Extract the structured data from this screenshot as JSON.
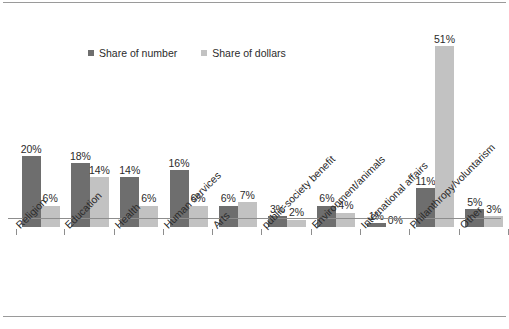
{
  "figure": {
    "background": "#ffffff",
    "border_color": "#9a9a9a",
    "axis_color": "#8d8d8d"
  },
  "legend": {
    "position": "top-left-inside",
    "entries": [
      {
        "label": "Share of number",
        "color": "#6e6e6e",
        "marker": "square-swatch-icon"
      },
      {
        "label": "Share of dollars",
        "color": "#c2c2c2",
        "marker": "square-swatch-icon"
      }
    ]
  },
  "chart_data": {
    "type": "bar",
    "title": "",
    "subtitle": "",
    "xlabel": "",
    "ylabel": "",
    "ylim": [
      0,
      55
    ],
    "grid": false,
    "legend_position": "top-left",
    "value_suffix": "%",
    "categories": [
      "Religion",
      "Education",
      "Health",
      "Human services",
      "Arts",
      "public-society benefit",
      "Environment/animals",
      "International affairs",
      "Philanthropy/voluntarism",
      "Other"
    ],
    "series": [
      {
        "name": "Share of number",
        "color": "#6e6e6e",
        "values": [
          20,
          18,
          14,
          16,
          6,
          3,
          6,
          1,
          11,
          5
        ],
        "labels": [
          "20%",
          "18%",
          "14%",
          "16%",
          "6%",
          "3%",
          "6%",
          "1%",
          "11%",
          "5%"
        ]
      },
      {
        "name": "Share of dollars",
        "color": "#c2c2c2",
        "values": [
          6,
          14,
          6,
          6,
          7,
          2,
          4,
          0,
          51,
          3
        ],
        "labels": [
          "6%",
          "14%",
          "6%",
          "6%",
          "7%",
          "2%",
          "4%",
          "0%",
          "51%",
          "3%"
        ]
      }
    ]
  }
}
